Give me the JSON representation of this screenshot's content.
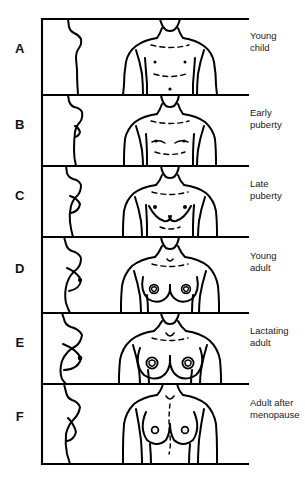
{
  "figure": {
    "panel_count": 6,
    "frame": {
      "left": 42,
      "right": 248,
      "top": 18,
      "bottom": 464
    },
    "ink_color": "#000000",
    "background_color": "#ffffff",
    "text_color": "#1a1a1a"
  },
  "panels": [
    {
      "letter": "A",
      "label": "Young\nchild",
      "letter_y": 48,
      "label_y": 30,
      "top": 18,
      "bottom": 95,
      "profile": "flat-child-chest-profile",
      "front": "child-torso-front-view"
    },
    {
      "letter": "B",
      "label": "Early\npuberty",
      "letter_y": 124,
      "label_y": 107,
      "top": 95,
      "bottom": 166,
      "profile": "early-puberty-chest-profile",
      "front": "early-puberty-torso-front-view"
    },
    {
      "letter": "C",
      "label": "Late\npuberty",
      "letter_y": 195,
      "label_y": 178,
      "top": 166,
      "bottom": 237,
      "profile": "late-puberty-chest-profile",
      "front": "late-puberty-torso-front-view"
    },
    {
      "letter": "D",
      "label": "Young\nadult",
      "letter_y": 268,
      "label_y": 250,
      "top": 237,
      "bottom": 313,
      "profile": "young-adult-breast-profile",
      "front": "young-adult-torso-front-view"
    },
    {
      "letter": "E",
      "label": "Lactating\nadult",
      "letter_y": 342,
      "label_y": 325,
      "top": 313,
      "bottom": 384,
      "profile": "lactating-adult-breast-profile",
      "front": "lactating-adult-torso-front-view"
    },
    {
      "letter": "F",
      "label": "Adult after\nmenopause",
      "letter_y": 416,
      "label_y": 397,
      "top": 384,
      "bottom": 464,
      "profile": "postmenopausal-breast-profile",
      "front": "postmenopausal-torso-front-view"
    }
  ]
}
